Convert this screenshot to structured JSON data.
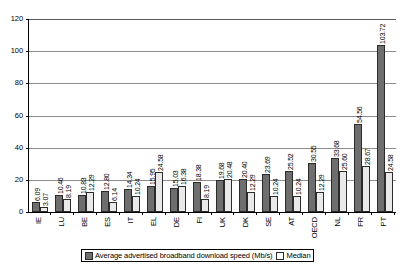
{
  "chart_data": {
    "type": "bar",
    "title": "",
    "subtitle": "",
    "xlabel": "",
    "ylabel": "",
    "ylim": [
      0,
      120
    ],
    "yticks": [
      0,
      20,
      40,
      60,
      80,
      100,
      120
    ],
    "grid": true,
    "legend_position": "bottom",
    "categories": [
      "IE",
      "LU",
      "BE",
      "ES",
      "IT",
      "EL",
      "DE",
      "FI",
      "UK",
      "DK",
      "SE",
      "AT",
      "OECD",
      "NL",
      "FR",
      "PT"
    ],
    "series": [
      {
        "name": "Average advertised broadband download speed (Mb/s)",
        "color": "#6e6e6e",
        "values": [
          6.09,
          10.46,
          10.83,
          12.8,
          14.34,
          15.95,
          15.03,
          18.38,
          19.68,
          20.4,
          23.69,
          25.52,
          30.55,
          33.68,
          54.56,
          103.72
        ],
        "labels": [
          "6.09",
          "10.46",
          "10.83",
          "12.80",
          "14.34",
          "15.95",
          "15.03",
          "18.38",
          "19.68",
          "20.40",
          "23.69",
          "25.52",
          "30.55",
          "33.68",
          "54.56",
          "103.72"
        ]
      },
      {
        "name": "Median",
        "color": "#e9e9e9",
        "values": [
          3.07,
          8.19,
          12.29,
          6.14,
          10.24,
          24.58,
          16.38,
          8.19,
          20.48,
          12.29,
          10.24,
          10.24,
          12.29,
          25.6,
          28.67,
          24.58
        ],
        "labels": [
          "3.07",
          "8.19",
          "12.29",
          "6.14",
          "10.24",
          "24.58",
          "16.38",
          "8.19",
          "20.48",
          "12.29",
          "10.24",
          "10.24",
          "12.29",
          "25.60",
          "28.67",
          "24.58"
        ]
      }
    ]
  }
}
